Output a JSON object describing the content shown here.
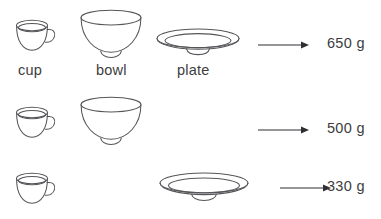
{
  "page": {
    "background_color": "#ffffff",
    "line_color": "#56565a",
    "text_color": "#3c3c40",
    "arrow_color": "#2f2f33"
  },
  "item_labels": {
    "cup": "cup",
    "bowl": "bowl",
    "plate": "plate"
  },
  "rows": [
    {
      "id": "row-1",
      "items": [
        "cup",
        "bowl",
        "plate"
      ],
      "weight": "650 g",
      "weight_value": 650,
      "weight_unit": "g"
    },
    {
      "id": "row-2",
      "items": [
        "cup",
        "bowl"
      ],
      "weight": "500 g",
      "weight_value": 500,
      "weight_unit": "g"
    },
    {
      "id": "row-3",
      "items": [
        "cup",
        "plate"
      ],
      "weight": "330 g",
      "weight_value": 330,
      "weight_unit": "g"
    }
  ],
  "icons": {
    "cup": "cup-icon",
    "bowl": "bowl-icon",
    "plate": "plate-icon",
    "arrow": "arrow-right-icon"
  }
}
